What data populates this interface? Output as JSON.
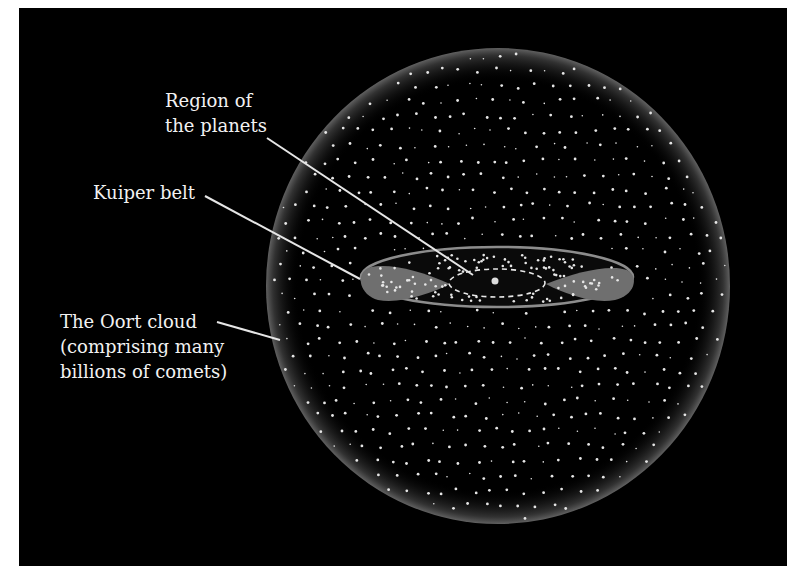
{
  "figure": {
    "background_color": "#000000",
    "page_color": "#ffffff",
    "label_color": "#f2f2f2",
    "comet_dot_color": "#e6e6e6",
    "lobe_fill_color": "#6f6f6f"
  },
  "labels": {
    "planets": {
      "line1": "Region of",
      "line2": "the planets"
    },
    "kuiper": {
      "line1": "Kuiper belt"
    },
    "oort": {
      "line1": "The Oort cloud",
      "line2": "(comprising many",
      "line3": "billions of comets)"
    }
  },
  "elements": {
    "oort_cloud": "sphere-of-comets",
    "kuiper_belt": "torus-lobes",
    "planet_orbits": "dashed-ellipse",
    "sun": "central-dot"
  }
}
